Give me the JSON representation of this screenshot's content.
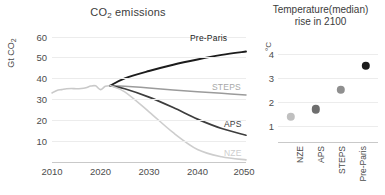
{
  "chart_data": [
    {
      "type": "line",
      "title": "CO2 emissions",
      "title_display": "CO₂ emissions",
      "xlabel": "",
      "ylabel": "Gt CO₂",
      "xlim": [
        2010,
        2050
      ],
      "ylim": [
        0,
        65
      ],
      "xticks": [
        2010,
        2020,
        2030,
        2040,
        2050
      ],
      "yticks": [
        10,
        20,
        30,
        40,
        50,
        60
      ],
      "grid": true,
      "legend_position": "inline-right-end-labels",
      "x": [
        2010,
        2011,
        2012,
        2013,
        2014,
        2015,
        2016,
        2017,
        2018,
        2019,
        2020,
        2021,
        2022,
        2025,
        2030,
        2035,
        2040,
        2045,
        2050
      ],
      "series": [
        {
          "name": "Historical",
          "color": "#c9c9c9",
          "values": [
            33.0,
            34.2,
            34.6,
            35.0,
            35.1,
            35.0,
            35.1,
            35.5,
            36.3,
            36.4,
            34.6,
            36.2,
            36.5,
            null,
            null,
            null,
            null,
            null,
            null
          ]
        },
        {
          "name": "Pre-Paris",
          "color": "#1c1c1c",
          "label_text": "Pre-Paris",
          "values": [
            null,
            null,
            null,
            null,
            null,
            null,
            null,
            null,
            null,
            null,
            null,
            null,
            36.5,
            40.0,
            43.5,
            46.5,
            49.0,
            51.2,
            52.8
          ]
        },
        {
          "name": "STEPS",
          "color": "#9b9b9b",
          "label_text": "STEPS",
          "values": [
            null,
            null,
            null,
            null,
            null,
            null,
            null,
            null,
            null,
            null,
            null,
            null,
            36.5,
            36.2,
            35.4,
            34.4,
            33.6,
            32.8,
            32.0
          ]
        },
        {
          "name": "APS",
          "color": "#3d3d3d",
          "label_text": "APS",
          "values": [
            null,
            null,
            null,
            null,
            null,
            null,
            null,
            null,
            null,
            null,
            null,
            null,
            36.5,
            35.0,
            31.0,
            26.0,
            20.5,
            16.0,
            12.8
          ]
        },
        {
          "name": "NZE",
          "color": "#cdcdcd",
          "label_text": "NZE",
          "values": [
            null,
            null,
            null,
            null,
            null,
            null,
            null,
            null,
            null,
            null,
            null,
            null,
            36.5,
            33.5,
            24.0,
            14.0,
            6.0,
            2.5,
            1.0
          ]
        }
      ]
    },
    {
      "type": "scatter",
      "title": "Temperature(median) rise in 2100",
      "title_line1": "Temperature(median)",
      "title_line2": "rise in 2100",
      "xlabel": "",
      "ylabel": "°C",
      "ylim": [
        0.6,
        4.4
      ],
      "yticks": [
        1,
        2,
        3,
        4
      ],
      "grid": true,
      "categories": [
        "NZE",
        "APS",
        "STEPS",
        "Pre-Paris"
      ],
      "values": [
        1.4,
        1.7,
        2.5,
        3.5
      ],
      "colors": [
        "#c0c0c0",
        "#6e6e6e",
        "#8f8f8f",
        "#1c1c1c"
      ]
    }
  ],
  "left": {
    "title_main": "CO",
    "title_sub": "2",
    "title_rest": " emissions",
    "ylabel_main": "Gt CO",
    "ylabel_sub": "2",
    "yticks": [
      "60",
      "50",
      "40",
      "30",
      "20",
      "10"
    ],
    "xticks": [
      "2010",
      "2020",
      "2030",
      "2040",
      "2050"
    ],
    "labels": {
      "pre_paris": "Pre-Paris",
      "steps": "STEPS",
      "aps": "APS",
      "nze": "NZE"
    }
  },
  "right": {
    "title_line1": "Temperature(median)",
    "title_line2": "rise in 2100",
    "ylabel": "°C",
    "yticks": [
      "4",
      "3",
      "2",
      "1"
    ],
    "xticks": [
      "NZE",
      "APS",
      "STEPS",
      "Pre-Paris"
    ]
  }
}
